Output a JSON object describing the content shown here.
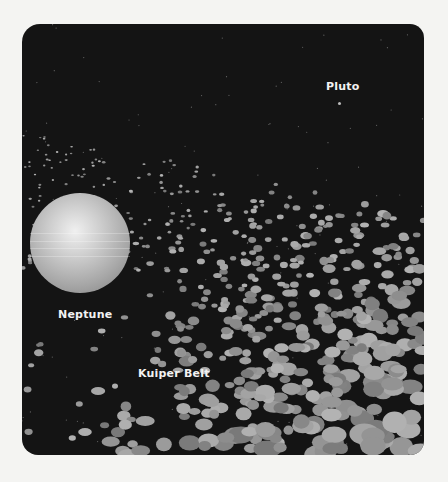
{
  "labels": {
    "pluto": "Pluto",
    "neptune": "Neptune",
    "kuiper_belt": "Kuiper Belt"
  },
  "colors": {
    "background": "#f4f4f2",
    "space": "#141414",
    "rock": "#9a9a9a",
    "text": "#f2f2f2"
  },
  "scene": {
    "neptune": {
      "cx": 58,
      "cy": 219,
      "r": 50
    },
    "pluto_dot": {
      "x": 318,
      "y": 79
    }
  }
}
